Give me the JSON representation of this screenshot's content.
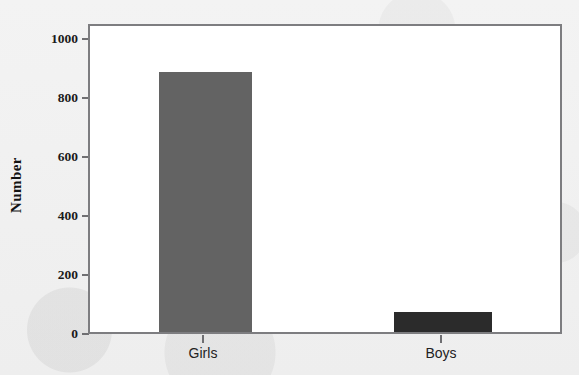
{
  "chart_data": {
    "type": "bar",
    "title": "",
    "subtitle": "",
    "xlabel": "",
    "ylabel": "Number",
    "categories": [
      "Girls",
      "Boys"
    ],
    "values": [
      888,
      68
    ],
    "series": [
      {
        "name": "Number",
        "values": [
          888,
          68
        ]
      }
    ],
    "ylim": [
      0,
      1060
    ],
    "ytick_values": [
      0,
      200,
      400,
      600,
      800,
      1000
    ],
    "ytick_labels": [
      "0",
      "200",
      "400",
      "600",
      "800",
      "1000"
    ],
    "grid": false,
    "legend": false,
    "legend_position": "none",
    "bar_colors": [
      "#636363",
      "#2b2b2b"
    ],
    "frame_color": "#7d7d80",
    "plot_background": "#ffffff",
    "page_background": "#f1f1f1",
    "axis_text_color": "#1b1b1b"
  }
}
